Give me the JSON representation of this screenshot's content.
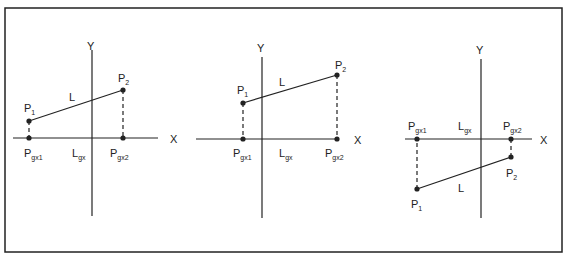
{
  "figure": {
    "frame": {
      "x": 5,
      "y": 8,
      "w": 557,
      "h": 244
    },
    "stroke_color": "#222222",
    "panels": [
      {
        "id": "panel-1",
        "axes": {
          "x_axis": {
            "x1": 13,
            "x2": 158,
            "y": 138,
            "label": "X",
            "label_x": 170,
            "label_y": 143
          },
          "y_axis": {
            "x": 92,
            "y1": 50,
            "y2": 216,
            "label": "Y",
            "label_x": 87,
            "label_y": 50
          }
        },
        "points": {
          "P1": {
            "x": 29,
            "y": 121,
            "label": "P",
            "sub": "1",
            "lx": 24,
            "ly": 112
          },
          "P2": {
            "x": 123,
            "y": 90,
            "label": "P",
            "sub": "2",
            "lx": 118,
            "ly": 82
          },
          "Pgx1": {
            "x": 29,
            "y": 138,
            "label": "P",
            "sub": "gx1",
            "lx": 24,
            "ly": 157
          },
          "Pgx2": {
            "x": 123,
            "y": 138,
            "label": "P",
            "sub": "gx2",
            "lx": 110,
            "ly": 157
          }
        },
        "line_label": {
          "text": "L",
          "x": 69,
          "y": 101
        },
        "proj_label": {
          "text": "L",
          "sub": "gx",
          "x": 72,
          "y": 157
        }
      },
      {
        "id": "panel-2",
        "axes": {
          "x_axis": {
            "x1": 196,
            "x2": 337,
            "y": 139,
            "label": "X",
            "label_x": 354,
            "label_y": 144
          },
          "y_axis": {
            "x": 262,
            "y1": 57,
            "y2": 218,
            "label": "Y",
            "label_x": 257,
            "label_y": 52
          }
        },
        "points": {
          "P1": {
            "x": 243,
            "y": 103,
            "label": "P",
            "sub": "1",
            "lx": 237,
            "ly": 94
          },
          "P2": {
            "x": 337,
            "y": 75,
            "label": "P",
            "sub": "2",
            "lx": 335,
            "ly": 69
          },
          "Pgx1": {
            "x": 243,
            "y": 139,
            "label": "P",
            "sub": "gx1",
            "lx": 233,
            "ly": 157
          },
          "Pgx2": {
            "x": 337,
            "y": 139,
            "label": "P",
            "sub": "gx2",
            "lx": 325,
            "ly": 157
          }
        },
        "line_label": {
          "text": "L",
          "x": 279,
          "y": 86
        },
        "proj_label": {
          "text": "L",
          "sub": "gx",
          "x": 279,
          "y": 157
        }
      },
      {
        "id": "panel-3",
        "axes": {
          "x_axis": {
            "x1": 405,
            "x2": 532,
            "y": 139,
            "label": "X",
            "label_x": 540,
            "label_y": 144
          },
          "y_axis": {
            "x": 481,
            "y1": 59,
            "y2": 218,
            "label": "Y",
            "label_x": 476,
            "label_y": 54
          }
        },
        "points": {
          "P1": {
            "x": 417,
            "y": 189,
            "label": "P",
            "sub": "1",
            "lx": 411,
            "ly": 208
          },
          "P2": {
            "x": 511,
            "y": 157,
            "label": "P",
            "sub": "2",
            "lx": 506,
            "ly": 177
          },
          "Pgx1": {
            "x": 417,
            "y": 139,
            "label": "P",
            "sub": "gx1",
            "lx": 408,
            "ly": 130
          },
          "Pgx2": {
            "x": 511,
            "y": 139,
            "label": "P",
            "sub": "gx2",
            "lx": 503,
            "ly": 130
          }
        },
        "line_label": {
          "text": "L",
          "x": 458,
          "y": 192
        },
        "proj_label": {
          "text": "L",
          "sub": "gx",
          "x": 458,
          "y": 130
        }
      }
    ]
  }
}
